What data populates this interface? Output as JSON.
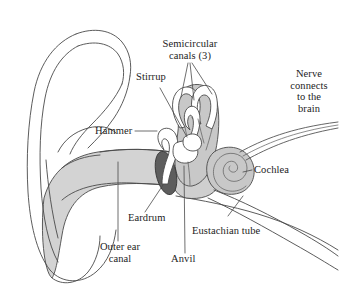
{
  "figure": {
    "background_color": "#ffffff",
    "line_color": "#4a4a4a",
    "text_color": "#1c1c1c"
  },
  "labels": {
    "semicircular_canals": "Semicircular\ncanals (3)",
    "stirrup": "Stirrup",
    "hammer": "Hammer",
    "nerve": "Nerve\nconnects\nto the\nbrain",
    "cochlea": "Cochlea",
    "eardrum": "Eardrum",
    "eustachian_tube": "Eustachian tube",
    "outer_ear_canal": "Outer ear\ncanal",
    "anvil": "Anvil"
  },
  "parts": {
    "pinna": "outer-ear-pinna",
    "ear_canal": "outer-ear-canal-passage",
    "eardrum": "tympanic-membrane",
    "hammer": "malleus-bone",
    "anvil": "incus-bone",
    "stirrup": "stapes-bone",
    "semicircular_canals": "semicircular-canals",
    "cochlea": "cochlea-spiral",
    "nerve": "auditory-nerve",
    "eustachian_tube": "eustachian-tube"
  },
  "colors": {
    "canal_fill": "#d3d3d3",
    "chamber_fill": "#cfcfcf",
    "inner_ear_fill": "#c8c8c8",
    "eardrum_fill": "#5d5d5d",
    "bone_fill": "#ffffff"
  }
}
